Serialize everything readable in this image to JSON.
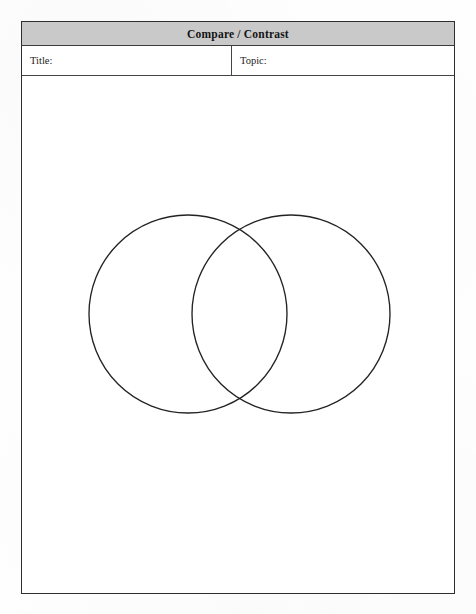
{
  "document": {
    "type": "worksheet",
    "orientation": "portrait",
    "page_background": "#fefefe",
    "frame_border_color": "#2e2e2e"
  },
  "header": {
    "title": "Compare / Contrast",
    "background_color": "#c9c9c9",
    "text_color": "#141414",
    "bold": true
  },
  "fields": {
    "title_label": "Title:",
    "title_value": "",
    "topic_label": "Topic:",
    "topic_value": ""
  },
  "diagram": {
    "name": "venn-diagram",
    "shape": "two-overlapping-circles",
    "stroke_color": "#232323",
    "fill": "none",
    "left_circle": {
      "cx": 166,
      "cy": 238,
      "r": 99,
      "label": ""
    },
    "right_circle": {
      "cx": 269,
      "cy": 238,
      "r": 99,
      "label": ""
    },
    "overlap_label": ""
  },
  "writing_area": {
    "label": "",
    "lines": []
  }
}
